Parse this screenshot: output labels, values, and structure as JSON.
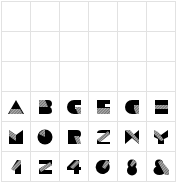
{
  "grid": {
    "columns": 6,
    "rows": 6,
    "line_color": "#e2e2e2",
    "empty_rows": 3
  },
  "glyphs": [
    {
      "char": "A"
    },
    {
      "char": "B"
    },
    {
      "char": "C"
    },
    {
      "char": "E"
    },
    {
      "char": "G"
    },
    {
      "char": "H"
    },
    {
      "char": "M"
    },
    {
      "char": "O"
    },
    {
      "char": "R"
    },
    {
      "char": "S"
    },
    {
      "char": "X"
    },
    {
      "char": "Y"
    },
    {
      "char": "1"
    },
    {
      "char": "2"
    },
    {
      "char": "4"
    },
    {
      "char": "6"
    },
    {
      "char": "8"
    },
    {
      "char": "&"
    }
  ],
  "colors": {
    "fill": "#000000",
    "hatch": "#8a8a8a"
  }
}
